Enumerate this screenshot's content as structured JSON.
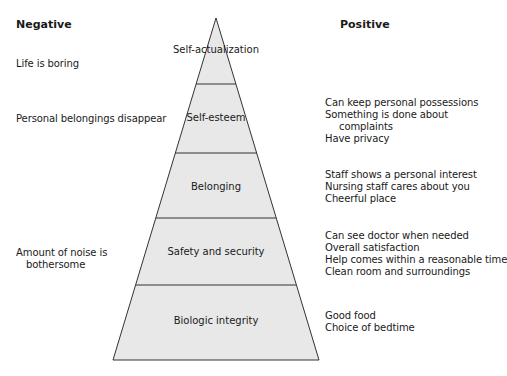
{
  "headers": {
    "negative": "Negative",
    "positive": "Positive"
  },
  "pyramid": {
    "fill": "#e8e8e8",
    "stroke": "#333333",
    "levels": [
      {
        "label": "Self-actualization"
      },
      {
        "label": "Self-esteem"
      },
      {
        "label": "Belonging"
      },
      {
        "label": "Safety and security"
      },
      {
        "label": "Biologic integrity"
      }
    ]
  },
  "negative": {
    "self_actualization": [
      "Life is boring"
    ],
    "self_esteem": [
      "Personal belongings disappear"
    ],
    "safety": [
      "Amount of noise is",
      "bothersome"
    ]
  },
  "positive": {
    "self_esteem": [
      "Can keep personal possessions",
      "Something is done about",
      "complaints",
      "Have privacy"
    ],
    "belonging": [
      "Staff shows a personal interest",
      "Nursing staff cares about you",
      "Cheerful place"
    ],
    "safety": [
      "Can see doctor when needed",
      "Overall satisfaction",
      "Help comes within a reasonable time",
      "Clean room and surroundings"
    ],
    "biologic": [
      "Good food",
      "Choice of bedtime"
    ]
  }
}
